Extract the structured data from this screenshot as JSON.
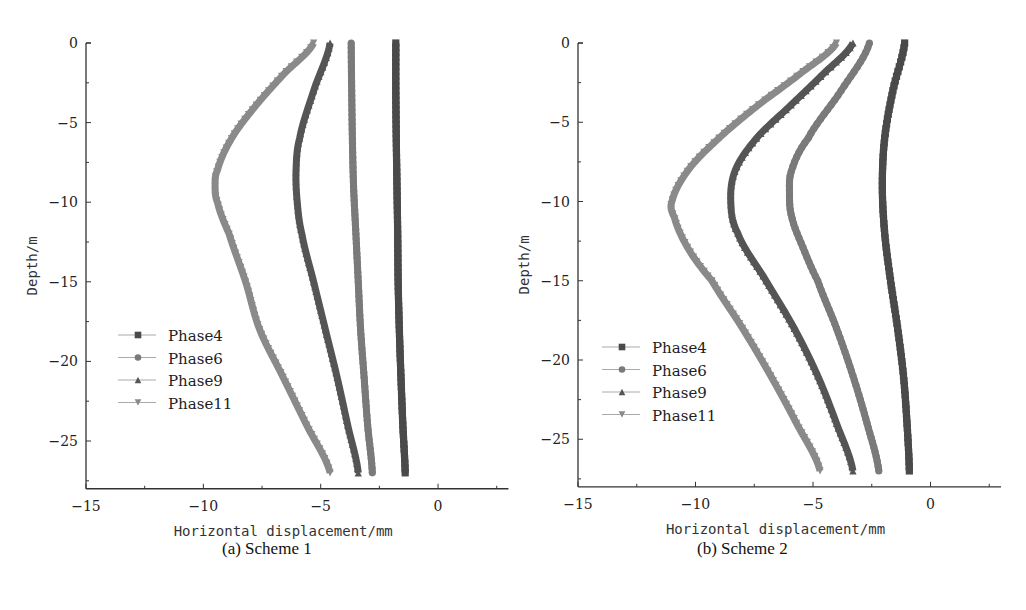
{
  "chart_data": [
    {
      "type": "line",
      "title": "(a) Scheme 1",
      "xlabel": "Horizontal displacement/mm",
      "ylabel": "Depth/m",
      "xlim": [
        -15,
        3
      ],
      "ylim": [
        -28,
        0
      ],
      "xticks": [
        -15,
        -10,
        -5,
        0
      ],
      "yticks": [
        0,
        -5,
        -10,
        -15,
        -20,
        -25
      ],
      "grid": false,
      "legend_position": "lower left",
      "series": [
        {
          "name": "Phase4",
          "marker": "square",
          "color": "#4a4a4a",
          "depth": [
            0,
            -3,
            -6,
            -9,
            -12,
            -15,
            -18,
            -21,
            -24,
            -27
          ],
          "displacement": [
            -1.8,
            -1.8,
            -1.78,
            -1.75,
            -1.72,
            -1.7,
            -1.65,
            -1.58,
            -1.5,
            -1.4
          ]
        },
        {
          "name": "Phase6",
          "marker": "circle",
          "color": "#7a7a7a",
          "depth": [
            0,
            -3,
            -6,
            -9,
            -12,
            -15,
            -18,
            -21,
            -24,
            -27
          ],
          "displacement": [
            -3.7,
            -3.68,
            -3.65,
            -3.6,
            -3.5,
            -3.4,
            -3.3,
            -3.15,
            -3.0,
            -2.8
          ]
        },
        {
          "name": "Phase9",
          "marker": "triangle-up",
          "color": "#555555",
          "depth": [
            0,
            -3,
            -6,
            -8,
            -10,
            -12,
            -15,
            -18,
            -21,
            -24,
            -27
          ],
          "displacement": [
            -4.6,
            -5.3,
            -5.9,
            -6.05,
            -6.0,
            -5.8,
            -5.3,
            -4.8,
            -4.3,
            -3.85,
            -3.4
          ]
        },
        {
          "name": "Phase11",
          "marker": "triangle-down",
          "color": "#8a8a8a",
          "depth": [
            0,
            -2,
            -4,
            -6,
            -8,
            -9,
            -10,
            -12,
            -15,
            -18,
            -21,
            -24,
            -27
          ],
          "displacement": [
            -5.3,
            -6.6,
            -7.8,
            -8.8,
            -9.4,
            -9.5,
            -9.4,
            -8.9,
            -8.2,
            -7.6,
            -6.6,
            -5.6,
            -4.6
          ]
        }
      ]
    },
    {
      "type": "line",
      "title": "(b) Scheme 2",
      "xlabel": "Horizontal displacement/mm",
      "ylabel": "Depth/m",
      "xlim": [
        -15,
        3
      ],
      "ylim": [
        -28,
        0
      ],
      "xticks": [
        -15,
        -10,
        -5,
        0
      ],
      "yticks": [
        0,
        -5,
        -10,
        -15,
        -20,
        -25
      ],
      "grid": false,
      "legend_position": "lower left",
      "series": [
        {
          "name": "Phase4",
          "marker": "square",
          "color": "#4a4a4a",
          "depth": [
            0,
            -3,
            -6,
            -9,
            -12,
            -15,
            -18,
            -21,
            -24,
            -27
          ],
          "displacement": [
            -1.1,
            -1.6,
            -1.95,
            -2.05,
            -1.95,
            -1.7,
            -1.4,
            -1.15,
            -1.0,
            -0.9
          ]
        },
        {
          "name": "Phase6",
          "marker": "circle",
          "color": "#7a7a7a",
          "depth": [
            0,
            -3,
            -6,
            -8,
            -9.5,
            -11,
            -13,
            -15,
            -18,
            -21,
            -24,
            -27
          ],
          "displacement": [
            -2.6,
            -3.8,
            -5.2,
            -5.9,
            -6.0,
            -5.9,
            -5.4,
            -4.8,
            -4.0,
            -3.3,
            -2.7,
            -2.2
          ]
        },
        {
          "name": "Phase9",
          "marker": "triangle-up",
          "color": "#555555",
          "depth": [
            0,
            -2,
            -4,
            -6,
            -8,
            -10,
            -12,
            -15,
            -18,
            -21,
            -24,
            -27
          ],
          "displacement": [
            -3.3,
            -4.6,
            -6.0,
            -7.4,
            -8.3,
            -8.5,
            -8.2,
            -7.0,
            -5.8,
            -4.8,
            -4.0,
            -3.3
          ]
        },
        {
          "name": "Phase11",
          "marker": "triangle-down",
          "color": "#8a8a8a",
          "depth": [
            0,
            -2,
            -4,
            -6,
            -8,
            -10,
            -11,
            -13,
            -15,
            -18,
            -21,
            -24,
            -27
          ],
          "displacement": [
            -4.0,
            -5.6,
            -7.4,
            -9.0,
            -10.3,
            -11.0,
            -10.9,
            -10.3,
            -9.3,
            -8.0,
            -6.8,
            -5.7,
            -4.7
          ]
        }
      ]
    }
  ],
  "panels": {
    "a": {
      "caption": "(a) Scheme 1",
      "xlabel": "Horizontal displacement/mm",
      "ylabel": "Depth/m",
      "xtick_labels": [
        "−15",
        "−10",
        "−5",
        "0"
      ],
      "ytick_labels": [
        "0",
        "−5",
        "−10",
        "−15",
        "−20",
        "−25"
      ],
      "legend": [
        "Phase4",
        "Phase6",
        "Phase9",
        "Phase11"
      ]
    },
    "b": {
      "caption": "(b) Scheme 2",
      "xlabel": "Horizontal displacement/mm",
      "ylabel": "Depth/m",
      "xtick_labels": [
        "−15",
        "−10",
        "−5",
        "0"
      ],
      "ytick_labels": [
        "0",
        "−5",
        "−10",
        "−15",
        "−20",
        "−25"
      ],
      "legend": [
        "Phase4",
        "Phase6",
        "Phase9",
        "Phase11"
      ]
    }
  }
}
